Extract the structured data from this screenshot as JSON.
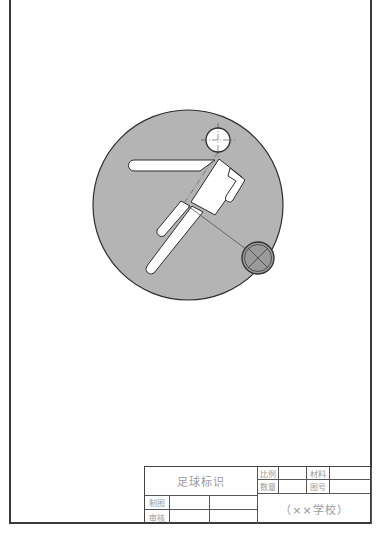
{
  "drawing": {
    "subject": "soccer-player-emblem",
    "colors": {
      "circle_fill": "#b4b4b4",
      "outline": "#2e2e2e",
      "figure_fill": "#ffffff",
      "ball_fill": "#9a9a9a",
      "centerline": "#555555"
    },
    "big_circle": {
      "cx": 188,
      "cy": 205,
      "r": 95
    },
    "head": {
      "cx": 218,
      "cy": 140,
      "r": 12
    },
    "ball": {
      "cx": 258,
      "cy": 258,
      "r": 16
    }
  },
  "title_block": {
    "drawing_name": "足球标识",
    "scale_label": "比例",
    "scale_value": "",
    "quantity_label": "数量",
    "quantity_value": "",
    "material_label": "材料",
    "material_value": "",
    "drawing_no_label": "图号",
    "drawing_no_value": "",
    "drawn_by_label": "制图",
    "drawn_by_value": "",
    "drawn_date": "",
    "checked_by_label": "审核",
    "checked_by_value": "",
    "checked_date": "",
    "school": "（××学校）"
  }
}
